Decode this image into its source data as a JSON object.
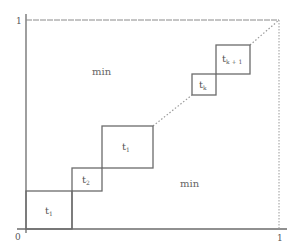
{
  "diagram": {
    "axis_labels": {
      "origin": "0",
      "y_top": "1",
      "x_right": "1"
    },
    "regions": [
      {
        "label": "min",
        "position": "upper-left"
      },
      {
        "label": "min",
        "position": "lower-right"
      }
    ],
    "boxes": [
      {
        "base": "t",
        "sub": "1",
        "note": "bottom-left box; subscript partially illegible"
      },
      {
        "base": "t",
        "sub": "2"
      },
      {
        "base": "t",
        "sub": "1",
        "note": "middle box; subscript partially illegible (may be i)"
      },
      {
        "base": "t",
        "sub": "k"
      },
      {
        "base": "t",
        "sub": "k + 1"
      }
    ],
    "diagonal": "dotted line from origin to (1,1)",
    "colors": {
      "line": "#6b6b6b",
      "dotted": "#9a9a9a",
      "text": "#555555"
    }
  }
}
